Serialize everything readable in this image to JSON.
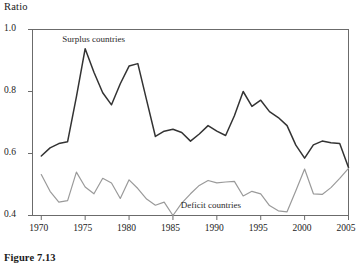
{
  "figure": {
    "caption": "Figure 7.13",
    "y_axis_title": "Ratio"
  },
  "chart_data": {
    "type": "line",
    "title": "",
    "xlabel": "",
    "ylabel": "Ratio",
    "xlim": [
      1969,
      2005
    ],
    "ylim": [
      0.4,
      1.0
    ],
    "xticks": [
      1970,
      1975,
      1980,
      1985,
      1990,
      1995,
      2000,
      2005
    ],
    "xtick_labels": [
      "1970",
      "1975",
      "1980",
      "1985",
      "1990",
      "1995",
      "2000",
      "2005"
    ],
    "yticks": [
      0.4,
      0.6,
      0.8,
      1.0
    ],
    "ytick_labels": [
      "0.4",
      "0.6",
      "0.8",
      "1.0"
    ],
    "grid": false,
    "legend": "annotations-inline",
    "annotations": [
      {
        "text": "Surplus countries",
        "x": 1976.5,
        "y": 0.965
      },
      {
        "text": "Deficit countries",
        "x": 1990.0,
        "y": 0.432
      }
    ],
    "x": [
      1970,
      1971,
      1972,
      1973,
      1974,
      1975,
      1976,
      1977,
      1978,
      1979,
      1980,
      1981,
      1982,
      1983,
      1984,
      1985,
      1986,
      1987,
      1988,
      1989,
      1990,
      1991,
      1992,
      1993,
      1994,
      1995,
      1996,
      1997,
      1998,
      1999,
      2000,
      2001,
      2002,
      2003,
      2004,
      2005
    ],
    "series": [
      {
        "name": "Surplus countries",
        "color": "#333333",
        "width": 1.5,
        "values": [
          0.592,
          0.618,
          0.632,
          0.638,
          0.783,
          0.938,
          0.862,
          0.796,
          0.757,
          0.825,
          0.882,
          0.89,
          0.772,
          0.655,
          0.672,
          0.678,
          0.668,
          0.64,
          0.663,
          0.69,
          0.672,
          0.658,
          0.722,
          0.8,
          0.752,
          0.772,
          0.735,
          0.716,
          0.69,
          0.627,
          0.585,
          0.628,
          0.64,
          0.635,
          0.632,
          0.555
        ]
      },
      {
        "name": "Deficit countries",
        "color": "#9a9a9a",
        "width": 1.2,
        "values": [
          0.532,
          0.478,
          0.443,
          0.448,
          0.54,
          0.492,
          0.47,
          0.52,
          0.505,
          0.455,
          0.515,
          0.487,
          0.453,
          0.433,
          0.443,
          0.4,
          0.44,
          0.47,
          0.497,
          0.513,
          0.505,
          0.508,
          0.51,
          0.463,
          0.478,
          0.47,
          0.432,
          0.415,
          0.412,
          0.48,
          0.55,
          0.47,
          0.468,
          0.49,
          0.52,
          0.552
        ]
      }
    ]
  }
}
